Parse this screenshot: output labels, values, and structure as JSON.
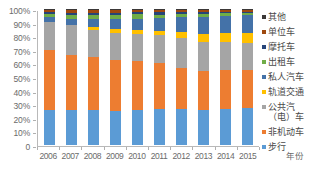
{
  "chart_data": {
    "type": "bar",
    "subtype": "stacked-percentage-column",
    "title": "",
    "xlabel": "年份",
    "ylabel": "",
    "categories": [
      "2006",
      "2007",
      "2008",
      "2009",
      "2010",
      "2011",
      "2012",
      "2013",
      "2014",
      "2015"
    ],
    "ylim": [
      0,
      100
    ],
    "ytick_labels": [
      "0",
      "10%",
      "20%",
      "30%",
      "40%",
      "50%",
      "60%",
      "70%",
      "80%",
      "90%",
      "100%"
    ],
    "ytick_values": [
      0,
      10,
      20,
      30,
      40,
      50,
      60,
      70,
      80,
      90,
      100
    ],
    "grid": false,
    "legend_position": "right",
    "series": [
      {
        "name": "步行",
        "color": "#5b9bd5",
        "values": [
          25.5,
          26.0,
          25.5,
          25.0,
          26.0,
          26.5,
          26.5,
          25.5,
          26.5,
          27.0
        ]
      },
      {
        "name": "非机动车",
        "color": "#ed7d31",
        "values": [
          44.5,
          40.5,
          39.0,
          37.5,
          35.5,
          33.5,
          30.5,
          29.0,
          28.5,
          28.0
        ]
      },
      {
        "name": "公共汽（电）车",
        "color": "#a5a5a5",
        "values": [
          20.5,
          21.5,
          20.0,
          20.0,
          20.5,
          21.0,
          21.5,
          21.5,
          21.0,
          20.0
        ]
      },
      {
        "name": "轨道交通",
        "color": "#ffc000",
        "values": [
          0.0,
          0.0,
          2.0,
          2.5,
          2.5,
          3.0,
          4.5,
          5.5,
          6.5,
          7.5
        ]
      },
      {
        "name": "私人汽车",
        "color": "#4472a8",
        "values": [
          3.5,
          5.0,
          6.5,
          7.5,
          8.5,
          9.5,
          11.0,
          12.5,
          12.5,
          13.0
        ]
      },
      {
        "name": "出租车",
        "color": "#70ad47",
        "values": [
          2.0,
          2.5,
          2.5,
          3.0,
          3.0,
          2.5,
          2.5,
          2.5,
          2.0,
          1.5
        ]
      },
      {
        "name": "摩托车",
        "color": "#264478",
        "values": [
          1.5,
          1.5,
          1.5,
          1.5,
          1.5,
          1.5,
          1.5,
          1.5,
          1.0,
          1.0
        ]
      },
      {
        "name": "单位车",
        "color": "#9e480e",
        "values": [
          2.0,
          2.5,
          2.5,
          2.5,
          2.0,
          2.0,
          1.5,
          1.5,
          1.5,
          1.5
        ]
      },
      {
        "name": "其他",
        "color": "#3b3838",
        "values": [
          0.5,
          0.5,
          0.5,
          0.5,
          0.5,
          0.5,
          0.5,
          0.5,
          0.5,
          0.5
        ]
      }
    ],
    "legend_order_top_to_bottom": [
      "其他",
      "单位车",
      "摩托车",
      "出租车",
      "私人汽车",
      "轨道交通",
      "公共汽（电）车",
      "非机动车",
      "步行"
    ]
  }
}
